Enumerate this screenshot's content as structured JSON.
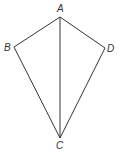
{
  "diagram": {
    "type": "kite",
    "stroke_color": "#333333",
    "background": "#ffffff",
    "vertices": {
      "A": {
        "label": "A",
        "x": 60,
        "y": 17,
        "label_x": 60,
        "label_y": 12
      },
      "B": {
        "label": "B",
        "x": 14,
        "y": 47,
        "label_x": 9,
        "label_y": 51
      },
      "C": {
        "label": "C",
        "x": 60,
        "y": 138,
        "label_x": 59,
        "label_y": 149
      },
      "D": {
        "label": "D",
        "x": 105,
        "y": 48,
        "label_x": 110,
        "label_y": 52
      }
    },
    "edges": [
      [
        "A",
        "B"
      ],
      [
        "B",
        "C"
      ],
      [
        "C",
        "D"
      ],
      [
        "D",
        "A"
      ],
      [
        "A",
        "C"
      ]
    ]
  }
}
